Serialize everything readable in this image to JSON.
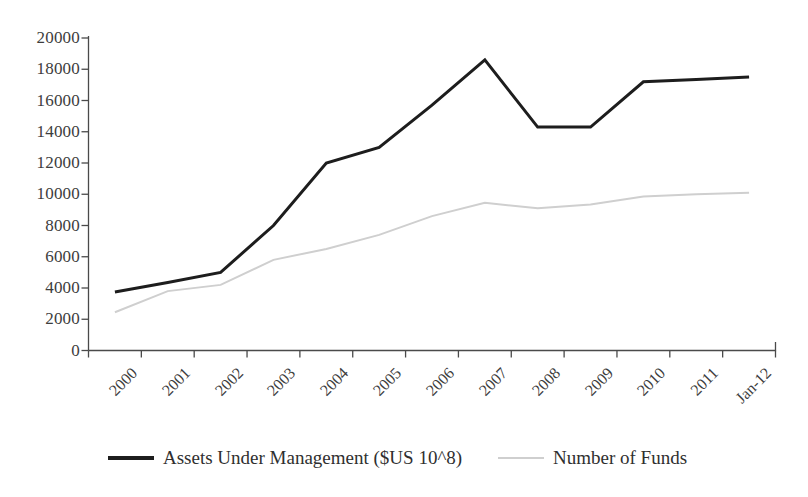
{
  "chart_data": {
    "type": "line",
    "title": "",
    "subtitle": "",
    "xlabel": "",
    "ylabel": "",
    "categories": [
      "2000",
      "2001",
      "2002",
      "2003",
      "2004",
      "2005",
      "2006",
      "2007",
      "2008",
      "2009",
      "2010",
      "2011",
      "Jan-12"
    ],
    "ylim": [
      0,
      20000
    ],
    "ytick_values": [
      0,
      2000,
      4000,
      6000,
      8000,
      10000,
      12000,
      14000,
      16000,
      18000,
      20000
    ],
    "ytick_labels": [
      "0",
      "2000",
      "4000",
      "6000",
      "8000",
      "10000",
      "12000",
      "14000",
      "16000",
      "18000",
      "20000"
    ],
    "grid": false,
    "legend_position": "bottom",
    "series": [
      {
        "name": "Assets Under Management ($US 10^8)",
        "color": "#1d1d1d",
        "line_width": 3,
        "values": [
          3750,
          4350,
          5000,
          8000,
          12000,
          13000,
          15700,
          18600,
          14300,
          14300,
          17200,
          17350,
          17500
        ]
      },
      {
        "name": "Number of Funds",
        "color": "#cfcfcf",
        "line_width": 2,
        "values": [
          2450,
          3800,
          4200,
          5800,
          6500,
          7400,
          8600,
          9450,
          9100,
          9350,
          9850,
          10000,
          10100
        ]
      }
    ]
  },
  "legend": {
    "entries": [
      {
        "label": "Assets Under Management ($US 10^8)"
      },
      {
        "label": "Number of Funds"
      }
    ]
  },
  "axes": {
    "y_tick_labels": [
      "20000",
      "18000",
      "16000",
      "14000",
      "12000",
      "10000",
      "8000",
      "6000",
      "4000",
      "2000",
      "0"
    ],
    "x_tick_labels": [
      "2000",
      "2001",
      "2002",
      "2003",
      "2004",
      "2005",
      "2006",
      "2007",
      "2008",
      "2009",
      "2010",
      "2011",
      "Jan-12"
    ]
  },
  "colors": {
    "series_primary": "#1d1d1d",
    "series_secondary": "#cfcfcf",
    "axis": "#4a4a4a",
    "text": "#3a3a3a",
    "background": "#ffffff"
  }
}
